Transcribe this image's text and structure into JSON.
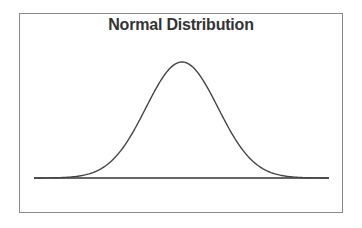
{
  "chart_data": {
    "type": "line",
    "title": "Normal Distribution",
    "xlabel": "",
    "ylabel": "",
    "grid": false,
    "legend": null,
    "axes_visible": false,
    "series": [
      {
        "name": "normal pdf",
        "distribution": "normal",
        "mean": 0,
        "std": 1,
        "x_range": [
          -4,
          4
        ],
        "x": [
          -4,
          -3.5,
          -3,
          -2.5,
          -2,
          -1.5,
          -1,
          -0.5,
          0,
          0.5,
          1,
          1.5,
          2,
          2.5,
          3,
          3.5,
          4
        ],
        "values": [
          0.0001,
          0.0009,
          0.0044,
          0.0175,
          0.054,
          0.1295,
          0.242,
          0.3521,
          0.3989,
          0.3521,
          0.242,
          0.1295,
          0.054,
          0.0175,
          0.0044,
          0.0009,
          0.0001
        ]
      }
    ],
    "baseline": true,
    "colors": {
      "curve": "#444444",
      "frame": "#8a8a8a",
      "title": "#333333"
    }
  },
  "layout": {
    "px_center": 182,
    "px_sigma": 36,
    "px_baseline_y": 178,
    "px_peak_y": 62,
    "px_x_start": 34,
    "px_x_end": 329
  }
}
